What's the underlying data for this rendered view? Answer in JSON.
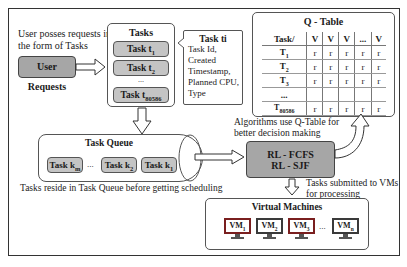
{
  "user_note": [
    "User posses requests in",
    "the form of Tasks"
  ],
  "user_requests": {
    "label": "User Requests"
  },
  "tasks": {
    "title": "Tasks",
    "items": [
      {
        "label": "Task t",
        "sub": "1"
      },
      {
        "label": "Task t",
        "sub": "2"
      },
      {
        "label": "Task t",
        "sub": "80586"
      }
    ],
    "ellipsis": "..."
  },
  "task_attributes": {
    "title": "Task ti",
    "lines": [
      "Task Id,",
      "Created",
      "Timestamp,",
      "Planned CPU,",
      "Type"
    ]
  },
  "q_table": {
    "title": "Q - Table",
    "header": [
      "Task/",
      "V",
      "V",
      "V",
      "...",
      "V"
    ],
    "rows": [
      {
        "label": "T",
        "sub": "1",
        "cells": [
          "r",
          "r",
          "r",
          "r",
          "r"
        ]
      },
      {
        "label": "T",
        "sub": "2",
        "cells": [
          "r",
          "r",
          "r",
          "r",
          "r"
        ]
      },
      {
        "label": "T",
        "sub": "3",
        "cells": [
          "r",
          "r",
          "r",
          "r",
          "r"
        ]
      },
      {
        "label": "...",
        "sub": "",
        "cells": [
          "",
          "",
          "",
          "",
          ""
        ]
      },
      {
        "label": "T",
        "sub": "80586",
        "cells": [
          "r",
          "r",
          "r",
          "r",
          "r"
        ]
      }
    ]
  },
  "task_queue": {
    "title": "Task Queue",
    "items": [
      {
        "label": "Task k",
        "sub": "m"
      },
      {
        "label": "Task k",
        "sub": "2"
      },
      {
        "label": "Task k",
        "sub": "1"
      }
    ],
    "ellipsis": "...",
    "note": "Tasks reside in Task Queue  before getting scheduling"
  },
  "algorithms": {
    "note": [
      "Algorithms use Q-Table for",
      "better decision making"
    ],
    "lines": [
      "RL - FCFS",
      "RL - SJF"
    ]
  },
  "submit_note": [
    "Tasks submitted to VMs",
    "for processing"
  ],
  "virtual_machines": {
    "title": "Virtual Machines",
    "items": [
      {
        "label": "VM",
        "sub": "1",
        "style": "red"
      },
      {
        "label": "VM",
        "sub": "2",
        "style": "dark"
      },
      {
        "label": "VM",
        "sub": "3",
        "style": "red"
      },
      {
        "label": "VM",
        "sub": "n",
        "style": "dark"
      }
    ],
    "ellipsis": "..."
  },
  "colors": {
    "dark_box": "#a6a6a6",
    "light_box": "#c4c4c4",
    "vm_red": "#7a1f1f",
    "vm_dark": "#3a3a3a"
  }
}
